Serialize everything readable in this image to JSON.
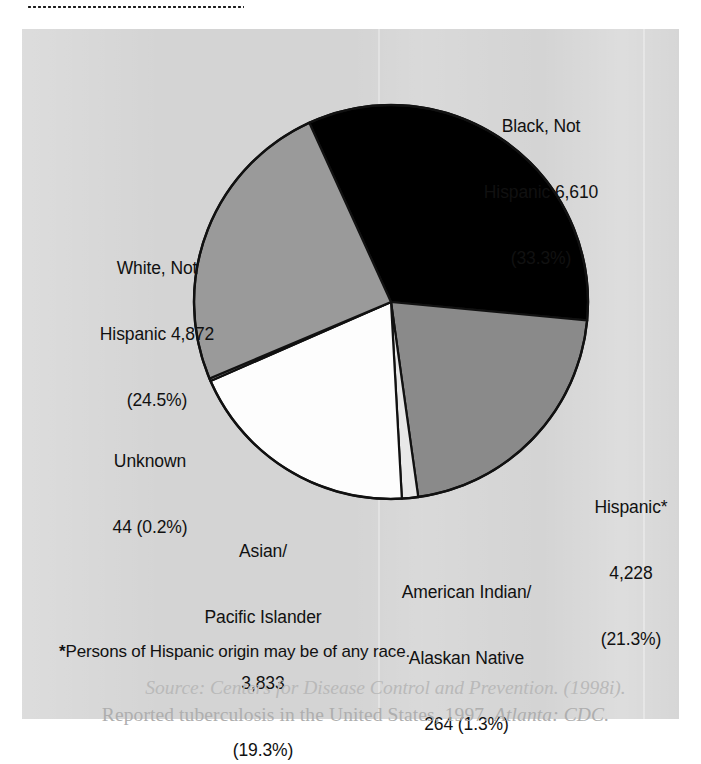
{
  "figure": {
    "background_color": "#d4d4d4",
    "footnote": {
      "marker": "*",
      "text": "Persons of Hispanic origin may be of any race."
    },
    "source": {
      "line1_label": "Source:",
      "line1_rest": " Centers for Disease Control and Prevention. (1998i).",
      "line2_a": "Reported tuberculosis in the United States, 1997. ",
      "line2_b": "Atlanta: CDC."
    }
  },
  "chart_data": {
    "type": "pie",
    "title": "",
    "total": 19851,
    "legend_position": "callout-labels",
    "start_angle_deg": -24.5,
    "direction": "clockwise",
    "categories": [
      "Black, Not Hispanic",
      "Hispanic*",
      "American Indian/Alaskan Native",
      "Asian/Pacific Islander",
      "Unknown",
      "White, Not Hispanic"
    ],
    "values": [
      6610,
      4228,
      264,
      3833,
      44,
      4872
    ],
    "percents": [
      33.3,
      21.3,
      1.3,
      19.3,
      0.2,
      24.5
    ],
    "colors": [
      "#000000",
      "#8a8a8a",
      "#e8e8e8",
      "#fdfdfd",
      "#9a9a9a",
      "#9a9a9a"
    ],
    "slices": [
      {
        "name": "black-not-hispanic",
        "label_line1": "Black, Not",
        "label_line2": "Hispanic 6,610",
        "label_line3": "(33.3%)",
        "value": 6610,
        "percent": 33.3,
        "color": "#000000"
      },
      {
        "name": "hispanic",
        "label_line1": "Hispanic*",
        "label_line2": "4,228",
        "label_line3": "(21.3%)",
        "value": 4228,
        "percent": 21.3,
        "color": "#8a8a8a"
      },
      {
        "name": "american-indian-alaskan-native",
        "label_line1": "American Indian/",
        "label_line2": "Alaskan Native",
        "label_line3": "264 (1.3%)",
        "value": 264,
        "percent": 1.3,
        "color": "#e8e8e8"
      },
      {
        "name": "asian-pacific-islander",
        "label_line1": "Asian/",
        "label_line2": "Pacific Islander",
        "label_line3": "3,833",
        "label_line4": "(19.3%)",
        "value": 3833,
        "percent": 19.3,
        "color": "#fdfdfd"
      },
      {
        "name": "unknown",
        "label_line1": "Unknown",
        "label_line2": "44 (0.2%)",
        "value": 44,
        "percent": 0.2,
        "color": "#9a9a9a"
      },
      {
        "name": "white-not-hispanic",
        "label_line1": "White, Not",
        "label_line2": "Hispanic 4,872",
        "label_line3": "(24.5%)",
        "value": 4872,
        "percent": 24.5,
        "color": "#9a9a9a"
      }
    ]
  }
}
